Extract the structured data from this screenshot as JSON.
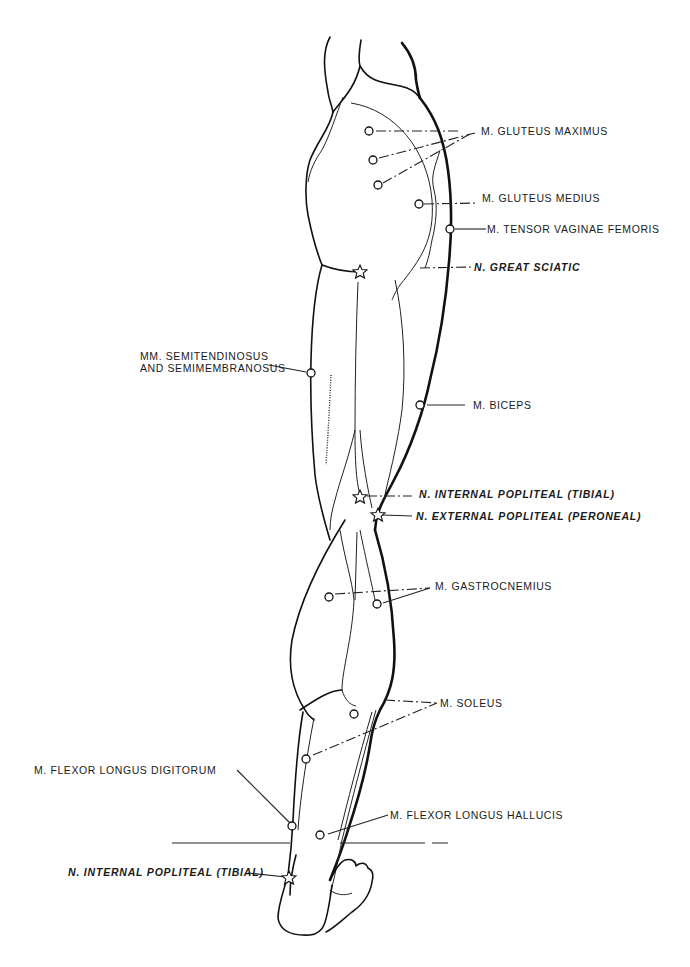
{
  "figure": {
    "legend_symbols": {
      "circle": "muscle motor point",
      "star": "nerve stimulation point"
    }
  },
  "labels": {
    "gluteus_maximus": "M. GLUTEUS MAXIMUS",
    "gluteus_medius": "M. GLUTEUS MEDIUS",
    "tensor_vaginae_femoris": "M. TENSOR VAGINAE FEMORIS",
    "great_sciatic": "N. GREAT SCIATIC",
    "semitendinosus_line1": "MM. SEMITENDINOSUS",
    "semitendinosus_line2": "AND SEMIMEMBRANOSUS",
    "biceps": "M. BICEPS",
    "internal_popliteal": "N. INTERNAL POPLITEAL (TIBIAL)",
    "external_popliteal": "N. EXTERNAL POPLITEAL (PERONEAL)",
    "gastrocnemius": "M. GASTROCNEMIUS",
    "soleus": "M. SOLEUS",
    "flexor_longus_digitorum": "M. FLEXOR LONGUS DIGITORUM",
    "flexor_longus_hallucis": "M. FLEXOR LONGUS HALLUCIS",
    "internal_popliteal_ankle": "N. INTERNAL POPLITEAL (TIBIAL)"
  }
}
